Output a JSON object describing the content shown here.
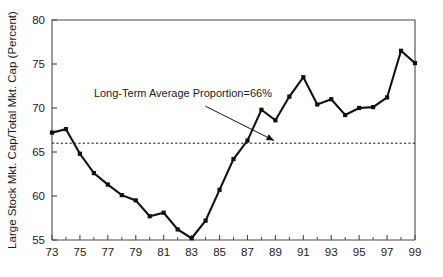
{
  "chart_data": {
    "type": "line",
    "title": "",
    "xlabel": "",
    "ylabel": "Large Stock Mkt. Cap/Total Mkt. Cap (Percent)",
    "xlim": [
      73,
      99
    ],
    "ylim": [
      55,
      80
    ],
    "grid": false,
    "legend": null,
    "y_ticks": [
      55,
      60,
      65,
      70,
      75,
      80
    ],
    "y_tick_labels": [
      "55",
      "60",
      "65",
      "70",
      "75",
      "80"
    ],
    "x_ticks": [
      73,
      75,
      77,
      79,
      81,
      83,
      85,
      87,
      89,
      91,
      93,
      95,
      97,
      99
    ],
    "x_tick_labels": [
      "73",
      "75",
      "77",
      "79",
      "81",
      "83",
      "85",
      "87",
      "89",
      "91",
      "93",
      "95",
      "97",
      "99"
    ],
    "x_minor_ticks": [
      74,
      76,
      78,
      80,
      82,
      84,
      86,
      88,
      90,
      92,
      94,
      96,
      98
    ],
    "x": [
      73,
      74,
      75,
      76,
      77,
      78,
      79,
      80,
      81,
      82,
      83,
      84,
      85,
      86,
      87,
      88,
      89,
      90,
      91,
      92,
      93,
      94,
      95,
      96,
      97,
      98,
      99
    ],
    "values": [
      67.2,
      67.6,
      64.8,
      62.6,
      61.3,
      60.1,
      59.5,
      57.7,
      58.1,
      56.2,
      55.2,
      57.2,
      60.7,
      64.2,
      66.3,
      69.8,
      68.6,
      71.3,
      73.5,
      70.4,
      71.0,
      69.2,
      70.0,
      70.1,
      71.2,
      76.5,
      75.1
    ],
    "series_name": "Large Stock Mkt. Cap Proportion",
    "marker": "square",
    "reference_line": {
      "value": 66,
      "style": "dashed",
      "label": "Long-Term Average Proportion=66%"
    },
    "annotations": [
      {
        "text": "Long-Term Average Proportion=66%",
        "text_x": 76.0,
        "text_y": 71.2,
        "arrow_from_x": 84.0,
        "arrow_from_y": 70.2,
        "arrow_to_x": 88.9,
        "arrow_to_y": 66.3
      }
    ]
  }
}
